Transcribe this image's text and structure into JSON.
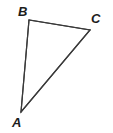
{
  "figure": {
    "type": "triangle",
    "background_color": "#ffffff",
    "stroke_color": "#3a3a3a",
    "stroke_width": 1.2,
    "label_color": "#1c1c1c",
    "vertices": [
      {
        "name": "A",
        "label": "A",
        "x": 21,
        "y": 112
      },
      {
        "name": "B",
        "label": "B",
        "x": 29,
        "y": 20
      },
      {
        "name": "C",
        "label": "C",
        "x": 90,
        "y": 30
      }
    ],
    "edges": [
      {
        "name": "edge-AB",
        "from": "A",
        "to": "B"
      },
      {
        "name": "edge-BC",
        "from": "B",
        "to": "C"
      },
      {
        "name": "edge-CA",
        "from": "C",
        "to": "A"
      }
    ],
    "path": "M 21 112 L 29 20 L 90 30 Z"
  }
}
